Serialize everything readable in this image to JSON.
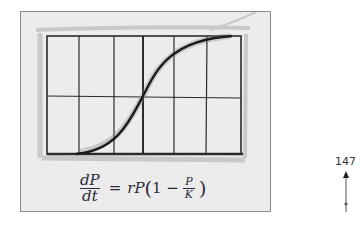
{
  "figure": {
    "type": "hand-drawn sketch",
    "grid": {
      "columns": 6,
      "rows": 2
    },
    "curve": "sigmoid",
    "colors": {
      "frame_bg": "#ececec",
      "frame_border": "#8a8a8a",
      "ink": "#1f1f1f",
      "pencil_shade": "#9a9a9a"
    }
  },
  "formula": {
    "lhs_numerator": "dP",
    "lhs_denominator": "dt",
    "equals": "=",
    "rhs_prefix": "rP",
    "open_paren": "(",
    "one_minus": "1 −",
    "inner_numerator": "P",
    "inner_denominator": "K",
    "close_paren": ")"
  },
  "annotation": {
    "label": "147",
    "icon": "up-arrow-icon"
  }
}
